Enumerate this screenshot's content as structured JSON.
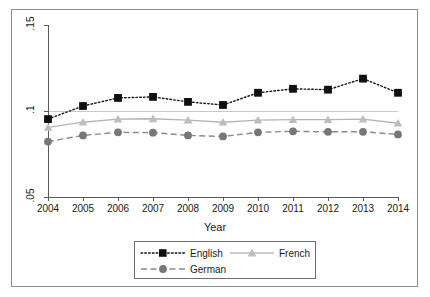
{
  "figure": {
    "x_axis_title": "Year",
    "y_axis_ticks": [
      ".15",
      ".1",
      ".05"
    ],
    "x_axis_ticks": [
      "2004",
      "2005",
      "2006",
      "2007",
      "2008",
      "2009",
      "2010",
      "2011",
      "2012",
      "2013",
      "2014"
    ]
  },
  "legend": {
    "entries": [
      {
        "label": "English",
        "marker": "square-marker",
        "line": "dotted",
        "color": "#101010"
      },
      {
        "label": "French",
        "marker": "triangle-marker",
        "line": "solid",
        "color": "#bdbdbd"
      },
      {
        "label": "German",
        "marker": "circle-marker",
        "line": "dashed",
        "color": "#777777"
      }
    ]
  },
  "chart_data": {
    "type": "line",
    "title": "",
    "subtitle": "",
    "xlabel": "Year",
    "ylabel": "",
    "x": [
      2004,
      2005,
      2006,
      2007,
      2008,
      2009,
      2010,
      2011,
      2012,
      2013,
      2014
    ],
    "categories": [
      "2004",
      "2005",
      "2006",
      "2007",
      "2008",
      "2009",
      "2010",
      "2011",
      "2012",
      "2013",
      "2014"
    ],
    "xlim": [
      2004,
      2014
    ],
    "ylim": [
      0.05,
      0.15
    ],
    "yticks": [
      0.05,
      0.1,
      0.15
    ],
    "ytick_labels": [
      ".05",
      ".1",
      ".15"
    ],
    "grid": true,
    "grid_lines_y": [
      0.1
    ],
    "legend_position": "below-axes",
    "series": [
      {
        "name": "English",
        "marker": "square",
        "linestyle": "dotted",
        "color": "#101010",
        "values": [
          0.0953,
          0.1029,
          0.1076,
          0.1082,
          0.1053,
          0.1035,
          0.1106,
          0.1129,
          0.1124,
          0.1188,
          0.1106
        ]
      },
      {
        "name": "French",
        "marker": "triangle",
        "linestyle": "solid",
        "color": "#bdbdbd",
        "values": [
          0.0905,
          0.0935,
          0.0953,
          0.0955,
          0.0947,
          0.0935,
          0.0947,
          0.095,
          0.095,
          0.0953,
          0.0929
        ]
      },
      {
        "name": "German",
        "marker": "circle",
        "linestyle": "dashed",
        "color": "#777777",
        "values": [
          0.0822,
          0.0858,
          0.0876,
          0.0874,
          0.0858,
          0.0852,
          0.0876,
          0.0882,
          0.0879,
          0.0879,
          0.0864
        ]
      }
    ]
  }
}
